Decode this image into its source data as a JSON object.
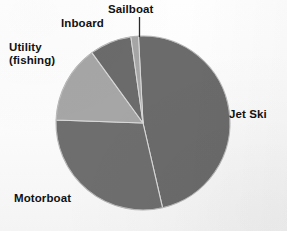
{
  "chart_data": {
    "type": "pie",
    "title": "",
    "subtitle": "",
    "xlabel": "",
    "ylabel": "",
    "legend_position": "none",
    "labels_position": "outside-callout",
    "grid": false,
    "start_angle_deg": -3,
    "direction": "clockwise",
    "categories": [
      "Jet Ski",
      "Motorboat",
      "Utility (fishing)",
      "Inboard",
      "Sailboat"
    ],
    "values": [
      46,
      29,
      14,
      8,
      3
    ],
    "units": "percent",
    "slices": [
      {
        "name": "Jet Ski",
        "label": "Jet Ski",
        "value": 46,
        "start_deg": 357,
        "end_deg": 167,
        "color": "#6b6b6b"
      },
      {
        "name": "Motorboat",
        "label": "Motorboat",
        "value": 29,
        "start_deg": 167,
        "end_deg": 272,
        "color": "#6e6e6e"
      },
      {
        "name": "Utility (fishing)",
        "label_line1": "Utility",
        "label_line2": "(fishing)",
        "value": 14,
        "start_deg": 272,
        "end_deg": 324,
        "color": "#a6a6a6"
      },
      {
        "name": "Inboard",
        "label": "Inboard",
        "value": 8,
        "start_deg": 324,
        "end_deg": 352,
        "color": "#6b6b6b"
      },
      {
        "name": "Sailboat",
        "label": "Sailboat",
        "value": 3,
        "start_deg": 352,
        "end_deg": 357,
        "color": "#a6a6a6"
      }
    ],
    "geometry": {
      "center_x": 143,
      "center_y": 123,
      "radius": 87
    },
    "colors": {
      "dark_gray": "#6b6b6b",
      "light_gray": "#a6a6a6",
      "separator": "#d9d9d9",
      "label_text": "#111111",
      "background": "#fdfdfd"
    }
  },
  "labels": {
    "sailboat": "Sailboat",
    "inboard": "Inboard",
    "utility_line1": "Utility",
    "utility_line2": "(fishing)",
    "jet_ski": "Jet Ski",
    "motorboat": "Motorboat"
  }
}
